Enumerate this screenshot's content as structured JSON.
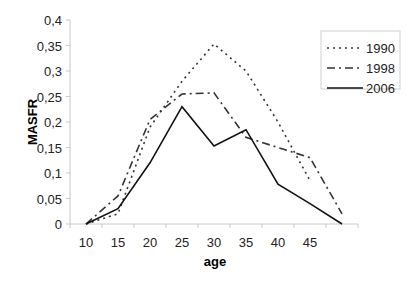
{
  "chart_data": {
    "type": "line",
    "title": "",
    "xlabel": "age",
    "ylabel": "MASFR",
    "categories": [
      "10",
      "15",
      "20",
      "25",
      "30",
      "35",
      "40",
      "45",
      ""
    ],
    "x": [
      10,
      15,
      20,
      25,
      30,
      35,
      40,
      45,
      50
    ],
    "ylim": [
      0,
      0.4
    ],
    "yticks": [
      "0",
      "0,05",
      "0,1",
      "0,15",
      "0,2",
      "0,25",
      "0,3",
      "0,35",
      "0,4"
    ],
    "grid": false,
    "legend_position": "top-right",
    "series": [
      {
        "name": "1990",
        "style": "dotted",
        "values": [
          0,
          0.02,
          0.19,
          0.28,
          0.353,
          0.3,
          0.2,
          0.085,
          null
        ]
      },
      {
        "name": "1998",
        "style": "dash-dot",
        "values": [
          0,
          0.055,
          0.205,
          0.255,
          0.257,
          0.17,
          0.15,
          0.13,
          0.02
        ]
      },
      {
        "name": "2006",
        "style": "solid",
        "values": [
          0,
          0.03,
          0.12,
          0.23,
          0.153,
          0.185,
          0.078,
          0.04,
          0
        ]
      }
    ]
  },
  "legend": {
    "items": [
      "1990",
      "1998",
      "2006"
    ]
  },
  "axes": {
    "x_title": "age",
    "y_title": "MASFR"
  }
}
